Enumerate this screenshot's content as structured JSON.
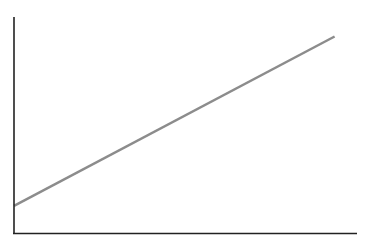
{
  "chart_data": {
    "type": "line",
    "title": "",
    "xlabel": "",
    "ylabel": "",
    "grid": false,
    "legend": null,
    "x": [
      0,
      1
    ],
    "series": [
      {
        "name": "line",
        "values": [
          0.13,
          0.91
        ],
        "color": "#8c8c8c"
      }
    ],
    "xlim": [
      0,
      1.07
    ],
    "ylim": [
      0,
      1
    ]
  },
  "colors": {
    "axis": "#222222",
    "line": "#8c8c8c",
    "background": "#ffffff"
  }
}
